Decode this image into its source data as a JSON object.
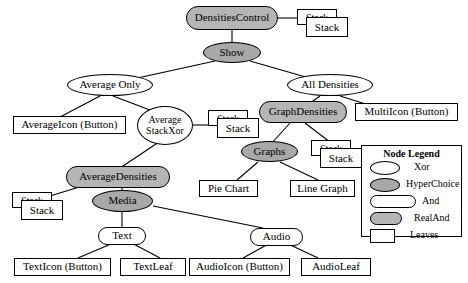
{
  "diagram": {
    "colors": {
      "hyperchoice_fill": "#a8a8a8",
      "realand_fill": "#b5b5b5",
      "xor_fill": "#ffffff",
      "and_fill": "#ffffff",
      "leaf_fill": "#ffffff",
      "stroke": "#000000",
      "background": "#ffffff"
    },
    "nodes": {
      "densities_control": "DensitiesControl",
      "show": "Show",
      "average_only": "Average Only",
      "all_densities": "All Densities",
      "average_icon_button": "AverageIcon (Button)",
      "average_stackxor_line1": "Average",
      "average_stackxor_line2": "StackXor",
      "graph_densities": "GraphDensities",
      "multi_icon_button": "MultiIcon (Button)",
      "graphs": "Graphs",
      "pie_chart": "Pie Chart",
      "line_graph": "Line Graph",
      "average_densities": "AverageDensities",
      "media": "Media",
      "text": "Text",
      "audio": "Audio",
      "text_icon_button": "TextIcon (Button)",
      "text_leaf": "TextLeaf",
      "audio_icon_button": "AudioIcon (Button)",
      "audio_leaf": "AudioLeaf"
    },
    "stacks": {
      "stack_top": "Stack",
      "stack_avg_xor": "Stack",
      "stack_graph": "Stack",
      "stack_avg_dens": "Stack"
    }
  },
  "legend": {
    "title": "Node Legend",
    "items": [
      {
        "label": "Xor",
        "shape": "ellipse",
        "fill": "#ffffff"
      },
      {
        "label": "HyperChoice",
        "shape": "ellipse",
        "fill": "#a8a8a8"
      },
      {
        "label": "And",
        "shape": "stadium",
        "fill": "#ffffff"
      },
      {
        "label": "RealAnd",
        "shape": "stadium",
        "fill": "#b5b5b5"
      },
      {
        "label": "Leaves",
        "shape": "rect",
        "fill": "#ffffff"
      }
    ]
  }
}
